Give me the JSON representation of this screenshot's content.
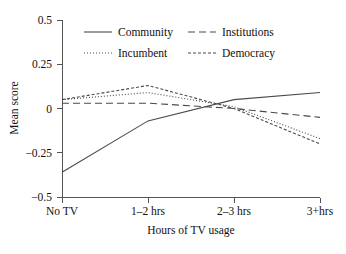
{
  "chart_data": {
    "type": "line",
    "title": "",
    "xlabel": "Hours of TV usage",
    "ylabel": "Mean score",
    "categories": [
      "No TV",
      "1–2 hrs",
      "2–3 hrs",
      "3+hrs"
    ],
    "ylim": [
      -0.5,
      0.5
    ],
    "yticks": [
      0.5,
      0.25,
      0,
      -0.25,
      -0.5
    ],
    "ytick_labels": [
      "0.5",
      "0.25",
      "0",
      "−0.25",
      "−0.5"
    ],
    "grid": false,
    "legend_position": "top-inside",
    "series": [
      {
        "name": "Community",
        "line_style": "solid",
        "dash": "none",
        "color": "#4a4a4a",
        "values": [
          -0.36,
          -0.07,
          0.05,
          0.09
        ]
      },
      {
        "name": "Incumbent",
        "line_style": "dotted",
        "dash": "1,2",
        "color": "#4a4a4a",
        "values": [
          0.05,
          0.09,
          0.01,
          -0.17
        ]
      },
      {
        "name": "Institutions",
        "line_style": "long-dash",
        "dash": "7,4",
        "color": "#4a4a4a",
        "values": [
          0.03,
          0.03,
          0.0,
          -0.05
        ]
      },
      {
        "name": "Democracy",
        "line_style": "short-dash",
        "dash": "3,2",
        "color": "#4a4a4a",
        "values": [
          0.05,
          0.13,
          0.0,
          -0.2
        ]
      }
    ]
  },
  "axis": {
    "y_label": "Mean score",
    "x_label": "Hours of TV usage",
    "y_ticks": [
      {
        "label": "0.5"
      },
      {
        "label": "0.25"
      },
      {
        "label": "0"
      },
      {
        "label": "−0.25"
      },
      {
        "label": "−0.5"
      }
    ],
    "x_ticks": [
      {
        "label": "No TV"
      },
      {
        "label": "1–2 hrs"
      },
      {
        "label": "2–3 hrs"
      },
      {
        "label": "3+hrs"
      }
    ]
  },
  "legend": {
    "entries": [
      {
        "label": "Community"
      },
      {
        "label": "Institutions"
      },
      {
        "label": "Incumbent"
      },
      {
        "label": "Democracy"
      }
    ]
  }
}
